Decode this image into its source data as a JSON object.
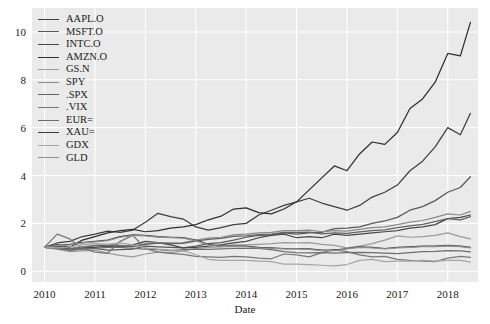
{
  "chart_data": {
    "type": "line",
    "title": "",
    "xlabel": "Date",
    "ylabel": "",
    "grid": true,
    "legend_position": "upper-left",
    "xlim": [
      2009.75,
      2018.6
    ],
    "ylim": [
      -0.45,
      11.0
    ],
    "xticks": [
      "2010",
      "2011",
      "2012",
      "2013",
      "2014",
      "2015",
      "2016",
      "2017",
      "2018"
    ],
    "yticks": [
      "0",
      "2",
      "4",
      "6",
      "8",
      "10"
    ],
    "x": [
      2010.0,
      2010.25,
      2010.5,
      2010.75,
      2011.0,
      2011.25,
      2011.5,
      2011.75,
      2012.0,
      2012.25,
      2012.5,
      2012.75,
      2013.0,
      2013.25,
      2013.5,
      2013.75,
      2014.0,
      2014.25,
      2014.5,
      2014.75,
      2015.0,
      2015.25,
      2015.5,
      2015.75,
      2016.0,
      2016.25,
      2016.5,
      2016.75,
      2017.0,
      2017.25,
      2017.5,
      2017.75,
      2018.0,
      2018.25,
      2018.45
    ],
    "series": [
      {
        "name": "AAPL.O",
        "color": "#3f3f3f",
        "values": [
          1.0,
          1.18,
          1.25,
          1.45,
          1.55,
          1.68,
          1.62,
          1.72,
          2.05,
          2.42,
          2.28,
          2.18,
          1.85,
          1.72,
          1.82,
          1.95,
          2.0,
          2.35,
          2.55,
          2.75,
          2.9,
          3.05,
          2.85,
          2.7,
          2.55,
          2.75,
          3.1,
          3.3,
          3.6,
          4.2,
          4.6,
          5.2,
          6.0,
          5.7,
          6.6
        ]
      },
      {
        "name": "MSFT.O",
        "color": "#595959",
        "values": [
          1.0,
          0.96,
          0.88,
          0.92,
          0.95,
          0.88,
          0.9,
          0.92,
          1.05,
          1.02,
          1.0,
          0.98,
          1.05,
          1.15,
          1.2,
          1.3,
          1.42,
          1.5,
          1.52,
          1.6,
          1.55,
          1.6,
          1.62,
          1.78,
          1.8,
          1.85,
          2.0,
          2.1,
          2.25,
          2.55,
          2.7,
          2.95,
          3.3,
          3.5,
          3.95
        ]
      },
      {
        "name": "INTC.O",
        "color": "#484848",
        "values": [
          1.0,
          1.05,
          0.95,
          0.98,
          1.0,
          1.05,
          1.02,
          1.1,
          1.25,
          1.2,
          1.1,
          0.98,
          1.0,
          1.05,
          1.1,
          1.18,
          1.25,
          1.4,
          1.5,
          1.55,
          1.4,
          1.45,
          1.4,
          1.55,
          1.5,
          1.55,
          1.6,
          1.65,
          1.7,
          1.8,
          1.85,
          1.95,
          2.2,
          2.25,
          2.35
        ]
      },
      {
        "name": "AMZN.O",
        "color": "#2f2f2f",
        "values": [
          1.0,
          1.1,
          1.0,
          1.3,
          1.45,
          1.6,
          1.7,
          1.75,
          1.65,
          1.7,
          1.8,
          1.85,
          1.95,
          2.15,
          2.3,
          2.6,
          2.65,
          2.45,
          2.4,
          2.6,
          2.9,
          3.4,
          3.9,
          4.4,
          4.2,
          4.9,
          5.4,
          5.3,
          5.8,
          6.8,
          7.2,
          7.9,
          9.1,
          9.0,
          10.4
        ]
      },
      {
        "name": "GS.N",
        "color": "#9a9a9a",
        "values": [
          1.0,
          0.92,
          0.82,
          0.85,
          0.88,
          0.76,
          0.66,
          0.6,
          0.72,
          0.8,
          0.78,
          0.85,
          0.95,
          1.0,
          1.02,
          1.1,
          1.1,
          1.12,
          1.15,
          1.2,
          1.18,
          1.2,
          1.12,
          1.08,
          0.98,
          1.05,
          1.15,
          1.3,
          1.48,
          1.42,
          1.45,
          1.5,
          1.6,
          1.45,
          1.35
        ]
      },
      {
        "name": "SPY",
        "color": "#8a8a8a",
        "values": [
          1.0,
          1.0,
          0.94,
          1.02,
          1.08,
          1.12,
          1.08,
          1.05,
          1.15,
          1.2,
          1.18,
          1.2,
          1.3,
          1.38,
          1.42,
          1.52,
          1.55,
          1.6,
          1.62,
          1.7,
          1.7,
          1.72,
          1.65,
          1.7,
          1.68,
          1.75,
          1.82,
          1.85,
          1.95,
          2.05,
          2.12,
          2.25,
          2.4,
          2.35,
          2.5
        ]
      },
      {
        "name": ".SPX",
        "color": "#636363",
        "values": [
          1.0,
          1.0,
          0.93,
          1.0,
          1.06,
          1.1,
          1.06,
          1.03,
          1.12,
          1.17,
          1.15,
          1.16,
          1.26,
          1.33,
          1.37,
          1.46,
          1.48,
          1.53,
          1.55,
          1.62,
          1.62,
          1.63,
          1.56,
          1.6,
          1.58,
          1.64,
          1.7,
          1.73,
          1.82,
          1.9,
          1.96,
          2.07,
          2.2,
          2.15,
          2.28
        ]
      },
      {
        "name": ".VIX",
        "color": "#777777",
        "values": [
          1.0,
          1.55,
          1.35,
          0.95,
          0.8,
          0.75,
          1.25,
          1.5,
          0.95,
          0.8,
          0.75,
          0.7,
          0.62,
          0.6,
          0.58,
          0.62,
          0.6,
          0.55,
          0.52,
          0.72,
          0.68,
          0.6,
          0.78,
          0.9,
          0.82,
          0.68,
          0.6,
          0.62,
          0.5,
          0.45,
          0.42,
          0.4,
          0.55,
          0.62,
          0.58
        ]
      },
      {
        "name": "EUR=",
        "color": "#6e6e6e",
        "values": [
          1.0,
          0.93,
          0.88,
          0.92,
          0.95,
          1.0,
          1.0,
          0.96,
          0.92,
          0.9,
          0.86,
          0.9,
          0.92,
          0.91,
          0.93,
          0.95,
          0.96,
          0.95,
          0.9,
          0.82,
          0.78,
          0.77,
          0.78,
          0.76,
          0.78,
          0.79,
          0.78,
          0.76,
          0.74,
          0.78,
          0.82,
          0.83,
          0.86,
          0.85,
          0.81
        ]
      },
      {
        "name": "XAU=",
        "color": "#3a3a3a",
        "values": [
          1.0,
          1.08,
          1.12,
          1.2,
          1.25,
          1.3,
          1.45,
          1.52,
          1.5,
          1.45,
          1.42,
          1.4,
          1.3,
          1.12,
          1.05,
          1.05,
          1.05,
          1.0,
          0.98,
          0.95,
          0.95,
          0.93,
          0.88,
          0.88,
          0.95,
          1.02,
          1.0,
          0.95,
          1.0,
          1.02,
          1.05,
          1.05,
          1.08,
          1.05,
          1.0
        ]
      },
      {
        "name": "GDX",
        "color": "#a5a5a5",
        "values": [
          1.0,
          0.98,
          1.02,
          1.1,
          1.15,
          1.12,
          1.18,
          1.1,
          0.98,
          0.92,
          0.88,
          0.85,
          0.7,
          0.5,
          0.45,
          0.45,
          0.45,
          0.42,
          0.4,
          0.3,
          0.3,
          0.28,
          0.25,
          0.22,
          0.28,
          0.45,
          0.5,
          0.4,
          0.42,
          0.42,
          0.45,
          0.42,
          0.45,
          0.45,
          0.38
        ]
      },
      {
        "name": "GLD",
        "color": "#8f8f8f",
        "values": [
          1.0,
          1.07,
          1.1,
          1.18,
          1.23,
          1.28,
          1.42,
          1.5,
          1.48,
          1.43,
          1.4,
          1.38,
          1.28,
          1.1,
          1.03,
          1.03,
          1.03,
          0.98,
          0.96,
          0.93,
          0.93,
          0.91,
          0.86,
          0.86,
          0.93,
          1.0,
          0.98,
          0.93,
          0.98,
          1.0,
          1.03,
          1.03,
          1.06,
          1.03,
          0.98
        ]
      }
    ]
  }
}
